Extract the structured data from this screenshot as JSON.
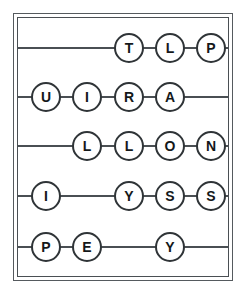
{
  "puzzle": {
    "title": "Letter Circles Grid",
    "frame": {
      "border_color": "#4a4f53",
      "background_color": "#ffffff"
    },
    "node_style": {
      "fill": "#ffffff",
      "stroke": "#2f3437",
      "text_color": "#14181a"
    },
    "columns": [
      46,
      87,
      129,
      170,
      211
    ],
    "rows": [
      {
        "index": 1,
        "line_y": 48,
        "nodes": [
          {
            "letter": "T",
            "column": 3,
            "x": 129
          },
          {
            "letter": "L",
            "column": 4,
            "x": 170
          },
          {
            "letter": "P",
            "column": 5,
            "x": 211
          }
        ]
      },
      {
        "index": 2,
        "line_y": 97,
        "nodes": [
          {
            "letter": "U",
            "column": 1,
            "x": 46
          },
          {
            "letter": "I",
            "column": 2,
            "x": 87
          },
          {
            "letter": "R",
            "column": 3,
            "x": 129
          },
          {
            "letter": "A",
            "column": 4,
            "x": 170
          }
        ]
      },
      {
        "index": 3,
        "line_y": 146,
        "nodes": [
          {
            "letter": "L",
            "column": 2,
            "x": 87
          },
          {
            "letter": "L",
            "column": 3,
            "x": 129
          },
          {
            "letter": "O",
            "column": 4,
            "x": 170
          },
          {
            "letter": "N",
            "column": 5,
            "x": 211
          }
        ]
      },
      {
        "index": 4,
        "line_y": 196,
        "nodes": [
          {
            "letter": "I",
            "column": 1,
            "x": 46
          },
          {
            "letter": "Y",
            "column": 3,
            "x": 129
          },
          {
            "letter": "S",
            "column": 4,
            "x": 170
          },
          {
            "letter": "S",
            "column": 5,
            "x": 211
          }
        ]
      },
      {
        "index": 5,
        "line_y": 247,
        "nodes": [
          {
            "letter": "P",
            "column": 1,
            "x": 46
          },
          {
            "letter": "E",
            "column": 2,
            "x": 87
          },
          {
            "letter": "Y",
            "column": 4,
            "x": 170
          }
        ]
      }
    ]
  }
}
